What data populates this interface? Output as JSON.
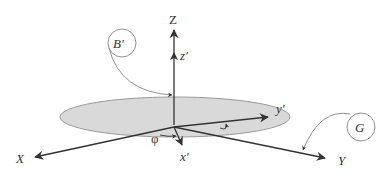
{
  "diagram": {
    "title": "",
    "labels": {
      "Z": "Z",
      "z_prime": "z′",
      "X": "X",
      "x_prime": "x′",
      "Y": "Y",
      "y_prime": "y′",
      "phi": "φ",
      "B_prime": "B′",
      "G": "G"
    },
    "colors": {
      "line": "#333333",
      "disk_fill": "#d9d9d9",
      "disk_stroke": "#9a9a9a",
      "callout_stroke": "#888888",
      "background": "#ffffff"
    }
  }
}
